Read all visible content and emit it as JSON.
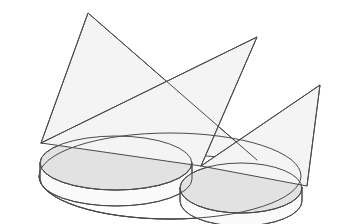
{
  "figure": {
    "background_color": "#ffffff",
    "stroke_color": "#4a4a4a",
    "cone_fill_color": "#f4f4f4",
    "disk_top_fill_color": "#e2e2e2",
    "disk_side_fill_color": "#fafafa",
    "outer_disk_fill_color": "#fbfbfb",
    "canvas": {
      "width": 339,
      "height": 224
    }
  },
  "shapes": {
    "outer_disk": {
      "name": "outer base disk",
      "cx": 170,
      "cy": 176,
      "rx": 131,
      "ry": 43,
      "fill": "#fbfbfb"
    },
    "left_disk": {
      "name": "left shaded elliptical disk",
      "top": {
        "cx": 116,
        "cy": 163,
        "rx": 76,
        "ry": 27
      },
      "depth": 16,
      "top_fill": "#e2e2e2",
      "side_fill": "#fafafa"
    },
    "right_disk": {
      "name": "right shaded elliptical disk",
      "top": {
        "cx": 241,
        "cy": 188,
        "rx": 61,
        "ry": 25
      },
      "depth": 13,
      "top_fill": "#e2e2e2",
      "side_fill": "#fafafa"
    }
  },
  "cones": [
    {
      "id": "cone-left",
      "label": "left cone sheet",
      "apex": {
        "x": 88,
        "y": 13
      },
      "base_a": {
        "x": 41,
        "y": 143
      },
      "base_b": {
        "x": 257,
        "y": 160
      },
      "fill": "#f4f4f4"
    },
    {
      "id": "cone-middle",
      "label": "middle cone sheet",
      "apex": {
        "x": 257,
        "y": 37
      },
      "base_a": {
        "x": 41,
        "y": 143
      },
      "base_b": {
        "x": 201,
        "y": 166
      },
      "fill": "#f4f4f4"
    },
    {
      "id": "cone-right",
      "label": "right cone sheet",
      "apex": {
        "x": 320,
        "y": 85
      },
      "base_a": {
        "x": 201,
        "y": 166
      },
      "base_b": {
        "x": 307,
        "y": 186
      },
      "fill": "#f4f4f4"
    }
  ],
  "intersections": [
    {
      "id": "x-upper",
      "x": 177,
      "y": 77
    },
    {
      "id": "x-lower-right",
      "x": 256,
      "y": 130
    }
  ],
  "labels": {
    "caption": "",
    "annotations": []
  }
}
